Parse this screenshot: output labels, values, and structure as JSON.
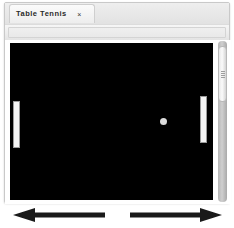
{
  "window": {
    "tab": {
      "title": "Table Tennis",
      "close_icon": "close-icon",
      "close_glyph": "×"
    },
    "toolbar": {
      "address_value": "",
      "address_placeholder": ""
    }
  },
  "game": {
    "name": "Table Tennis",
    "field_color": "#000000",
    "paddle_color": "#f4f4f4",
    "ball_color": "#dcdcdc",
    "left_paddle": {
      "x": 3,
      "y": 58,
      "width": 7,
      "height": 47
    },
    "right_paddle": {
      "x": 190,
      "y": 53,
      "width": 7,
      "height": 47
    },
    "ball": {
      "x": 150,
      "y": 75,
      "diameter": 7
    }
  },
  "scrollbar": {
    "orientation": "vertical",
    "thumb_top": 5,
    "thumb_height": 56,
    "grip_lines": 4
  },
  "annotations": {
    "arrow_left": {
      "name": "left-arrow-annotation",
      "direction": "left",
      "color": "#1a1a1a",
      "length": 92
    },
    "arrow_right": {
      "name": "right-arrow-annotation",
      "direction": "right",
      "color": "#1a1a1a",
      "length": 92
    }
  }
}
